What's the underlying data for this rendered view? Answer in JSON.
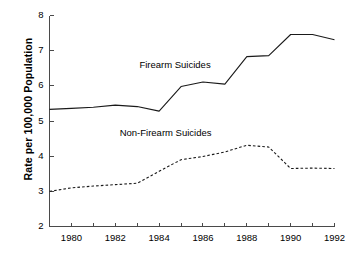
{
  "chart_data": {
    "type": "line",
    "title": "",
    "xlabel": "",
    "ylabel": "Rate per 100,000 Population",
    "xlim": [
      1979,
      1992
    ],
    "ylim": [
      2,
      8
    ],
    "grid": false,
    "legend_position": "inline-annotation",
    "x": [
      1979,
      1980,
      1981,
      1982,
      1983,
      1984,
      1985,
      1986,
      1987,
      1988,
      1989,
      1990,
      1991,
      1992
    ],
    "y_ticks": [
      2,
      3,
      4,
      5,
      6,
      7,
      8
    ],
    "y_tick_labels": [
      "2",
      "3",
      "4",
      "5",
      "6",
      "7",
      "8"
    ],
    "x_ticks": [
      1979,
      1980,
      1981,
      1982,
      1983,
      1984,
      1985,
      1986,
      1987,
      1988,
      1989,
      1990,
      1991,
      1992
    ],
    "x_tick_labels": [
      "",
      "1980",
      "",
      "1982",
      "",
      "1984",
      "",
      "1986",
      "",
      "1988",
      "",
      "1990",
      "",
      "1992"
    ],
    "series": [
      {
        "name": "Firearm Suicides",
        "style": "solid",
        "color": "#1a1a1a",
        "label_x": 1983.1,
        "label_y": 6.55,
        "values": [
          5.33,
          5.36,
          5.39,
          5.45,
          5.41,
          5.28,
          5.98,
          6.11,
          6.05,
          6.83,
          6.86,
          7.46,
          7.46,
          7.31
        ]
      },
      {
        "name": "Non-Firearm Suicides",
        "style": "dashed",
        "color": "#1a1a1a",
        "label_x": 1982.2,
        "label_y": 4.62,
        "values": [
          3.0,
          3.1,
          3.15,
          3.19,
          3.23,
          3.57,
          3.9,
          3.99,
          4.12,
          4.31,
          4.26,
          3.65,
          3.66,
          3.65
        ]
      }
    ]
  },
  "axis": {
    "y_axis_name": "y-axis",
    "x_axis_name": "x-axis"
  }
}
